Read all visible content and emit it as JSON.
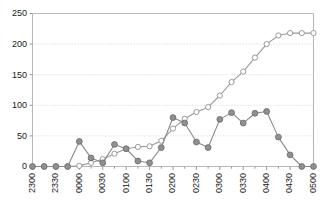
{
  "chart_data": {
    "type": "line",
    "title": "",
    "subtitle": "",
    "xlabel": "",
    "ylabel": "",
    "grid": true,
    "legend": "none",
    "ylim": [
      0,
      250
    ],
    "yticks": [
      0,
      50,
      100,
      150,
      200,
      250
    ],
    "ytick_labels": [
      "0",
      "50",
      "100",
      "150",
      "200",
      "250"
    ],
    "x": [
      "2300",
      "2315",
      "2330",
      "2345",
      "0000",
      "0015",
      "0030",
      "0045",
      "0100",
      "0115",
      "0130",
      "0145",
      "0200",
      "0215",
      "0230",
      "0245",
      "0300",
      "0315",
      "0330",
      "0345",
      "0400",
      "0415",
      "0430",
      "0445",
      "0500"
    ],
    "xtick_labels": [
      "2300",
      "2330",
      "0000",
      "0030",
      "0100",
      "0130",
      "0200",
      "0230",
      "0300",
      "0330",
      "0400",
      "0430",
      "0500"
    ],
    "xtick_indices": [
      0,
      2,
      4,
      6,
      8,
      10,
      12,
      14,
      16,
      18,
      20,
      22,
      24
    ],
    "minor_ticks": true,
    "series": [
      {
        "name": "cumulative",
        "marker": "open-circle",
        "color": "#9a9a9a",
        "line_color": "#9a9a9a",
        "fill": "#ffffff",
        "values": [
          0,
          0,
          0,
          0,
          1,
          6,
          12,
          21,
          29,
          32,
          33,
          42,
          62,
          78,
          89,
          97,
          116,
          138,
          155,
          178,
          200,
          214,
          218,
          218,
          218
        ]
      },
      {
        "name": "interval",
        "marker": "filled-circle",
        "color": "#6e6e6e",
        "line_color": "#8a8a8a",
        "fill": "#909090",
        "values": [
          0,
          0,
          0,
          0,
          41,
          14,
          6,
          36,
          29,
          9,
          6,
          31,
          80,
          71,
          40,
          31,
          77,
          88,
          71,
          87,
          90,
          48,
          19,
          0,
          0
        ]
      }
    ]
  },
  "axes": {
    "frame_color": "#b9b9b9",
    "grid_color": "#d9d9d9",
    "tick_color": "#9a9a9a",
    "text_color": "#1a1a1a"
  }
}
